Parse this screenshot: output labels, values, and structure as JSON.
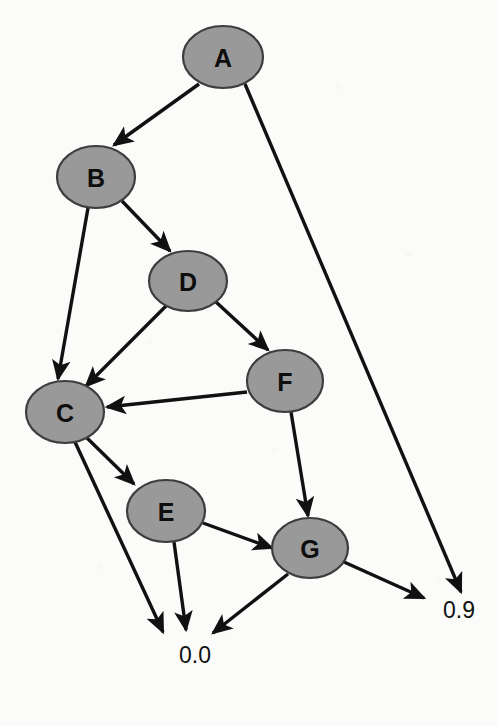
{
  "figure": {
    "type": "directed-graph",
    "background_color": "#fbfbf9",
    "node_fill_color": "#999999",
    "node_stroke_color": "#3d3d3d",
    "edge_color": "#111111",
    "label_color": "#0e0e0e"
  },
  "nodes": [
    {
      "id": "A",
      "label": "A",
      "cx": 223,
      "cy": 57,
      "rx": 40,
      "ry": 31
    },
    {
      "id": "B",
      "label": "B",
      "cx": 96,
      "cy": 177,
      "rx": 39,
      "ry": 31
    },
    {
      "id": "D",
      "label": "D",
      "cx": 188,
      "cy": 281,
      "rx": 39,
      "ry": 30
    },
    {
      "id": "F",
      "label": "F",
      "cx": 285,
      "cy": 381,
      "rx": 38,
      "ry": 31
    },
    {
      "id": "C",
      "label": "C",
      "cx": 65,
      "cy": 412,
      "rx": 39,
      "ry": 31
    },
    {
      "id": "E",
      "label": "E",
      "cx": 166,
      "cy": 511,
      "rx": 39,
      "ry": 31
    },
    {
      "id": "G",
      "label": "G",
      "cx": 310,
      "cy": 548,
      "rx": 38,
      "ry": 30
    }
  ],
  "terminals": [
    {
      "id": "zero-zero",
      "label": "0.0",
      "x": 195,
      "y": 655
    },
    {
      "id": "zero-nine",
      "label": "0.9",
      "x": 459,
      "y": 610
    }
  ],
  "edges": [
    {
      "id": "A-B",
      "from": "A",
      "to": "B",
      "x1": 199,
      "y1": 84,
      "x2": 114,
      "y2": 145,
      "arrow": true
    },
    {
      "id": "A-p9",
      "from": "A",
      "to": "zero-nine",
      "x1": 245,
      "y1": 84,
      "x2": 461,
      "y2": 592,
      "arrow": true
    },
    {
      "id": "B-D",
      "from": "B",
      "to": "D",
      "x1": 122,
      "y1": 201,
      "x2": 170,
      "y2": 251,
      "arrow": true
    },
    {
      "id": "B-C",
      "from": "B",
      "to": "C",
      "x1": 88,
      "y1": 208,
      "x2": 58,
      "y2": 379,
      "arrow": true
    },
    {
      "id": "D-C",
      "from": "D",
      "to": "C",
      "x1": 166,
      "y1": 306,
      "x2": 86,
      "y2": 386,
      "arrow": true
    },
    {
      "id": "D-F",
      "from": "D",
      "to": "F",
      "x1": 216,
      "y1": 302,
      "x2": 268,
      "y2": 350,
      "arrow": true
    },
    {
      "id": "F-C",
      "from": "F",
      "to": "C",
      "x1": 247,
      "y1": 392,
      "x2": 107,
      "y2": 407,
      "arrow": true
    },
    {
      "id": "F-G",
      "from": "F",
      "to": "G",
      "x1": 291,
      "y1": 412,
      "x2": 308,
      "y2": 516,
      "arrow": true
    },
    {
      "id": "C-E",
      "from": "C",
      "to": "E",
      "x1": 86,
      "y1": 437,
      "x2": 134,
      "y2": 484,
      "arrow": true
    },
    {
      "id": "C-p0",
      "from": "C",
      "to": "zero-zero",
      "x1": 75,
      "y1": 442,
      "x2": 163,
      "y2": 632,
      "arrow": true
    },
    {
      "id": "E-G",
      "from": "E",
      "to": "G",
      "x1": 203,
      "y1": 523,
      "x2": 272,
      "y2": 548,
      "arrow": true
    },
    {
      "id": "E-p0",
      "from": "E",
      "to": "zero-zero",
      "x1": 174,
      "y1": 542,
      "x2": 186,
      "y2": 630,
      "arrow": true
    },
    {
      "id": "G-p0",
      "from": "G",
      "to": "zero-zero",
      "x1": 288,
      "y1": 574,
      "x2": 213,
      "y2": 633,
      "arrow": true
    },
    {
      "id": "G-p9",
      "from": "G",
      "to": "zero-nine",
      "x1": 344,
      "y1": 562,
      "x2": 424,
      "y2": 598,
      "arrow": true
    }
  ],
  "chart_data": {
    "type": "diagram",
    "title": "",
    "nodes": [
      "A",
      "B",
      "C",
      "D",
      "E",
      "F",
      "G"
    ],
    "terminal_values": [
      "0.0",
      "0.9"
    ],
    "directed_edges": [
      [
        "A",
        "B"
      ],
      [
        "A",
        "0.9"
      ],
      [
        "B",
        "D"
      ],
      [
        "B",
        "C"
      ],
      [
        "D",
        "C"
      ],
      [
        "D",
        "F"
      ],
      [
        "F",
        "C"
      ],
      [
        "F",
        "G"
      ],
      [
        "C",
        "E"
      ],
      [
        "C",
        "0.0"
      ],
      [
        "E",
        "G"
      ],
      [
        "E",
        "0.0"
      ],
      [
        "G",
        "0.0"
      ],
      [
        "G",
        "0.9"
      ]
    ]
  }
}
